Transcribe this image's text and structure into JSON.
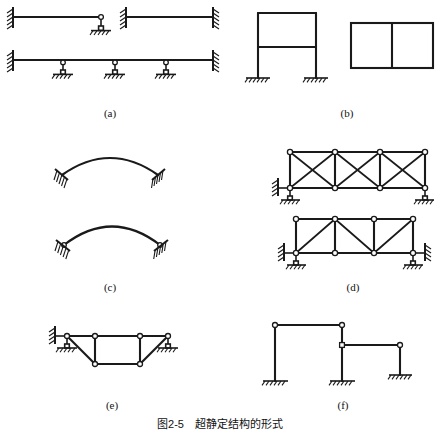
{
  "figure": {
    "caption": "图2-5　超静定结构的形式",
    "panels": [
      {
        "id": "a",
        "label": "(a)",
        "description": "beams: propped cantilever, fixed-fixed beam, continuous beam on links"
      },
      {
        "id": "b",
        "label": "(b)",
        "description": "two-story fixed-base frame and closed rectangular frame with center web"
      },
      {
        "id": "c",
        "label": "(c)",
        "description": "fixed arch and two-hinged arch"
      },
      {
        "id": "d",
        "label": "(d)",
        "description": "cross-braced truss and diagonal-braced truss"
      },
      {
        "id": "e",
        "label": "(e)",
        "description": "trapezoidal truss with hangers"
      },
      {
        "id": "f",
        "label": "(f)",
        "description": "stepped frame with three fixed bases and hinged joints"
      }
    ],
    "colors": {
      "line": "#1a1a1a",
      "node_fill": "#ffffff",
      "background": "#ffffff"
    }
  }
}
